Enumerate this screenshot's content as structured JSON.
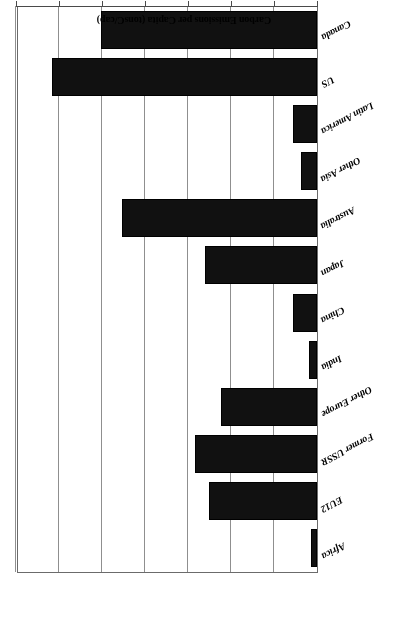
{
  "figure": {
    "orientation_note": "scanned-upside-down",
    "bar_color": "#111111",
    "grid_color": "#8f8f8f",
    "axis_color": "#4a4a4a"
  },
  "chart_data": {
    "type": "bar",
    "orientation": "horizontal",
    "title": "",
    "xlabel": "Carbon Emissions per Capita (tonsC/cap)",
    "ylabel": "",
    "xlim": [
      0.0,
      7.0
    ],
    "xticks": [
      "0.00",
      "1.00",
      "2.00",
      "3.00",
      "4.00",
      "5.00",
      "6.00",
      "7.00"
    ],
    "xtick_values": [
      0.0,
      1.0,
      2.0,
      3.0,
      4.0,
      5.0,
      6.0,
      7.0
    ],
    "grid": true,
    "legend": "none",
    "categories": [
      "Canada",
      "US",
      "Latin America",
      "Other Asia",
      "Australia",
      "Japan",
      "China",
      "India",
      "Other Europe",
      "Former USSR",
      "EU12",
      "Africa"
    ],
    "values": [
      5.02,
      6.16,
      0.56,
      0.37,
      4.53,
      2.6,
      0.56,
      0.19,
      2.23,
      2.84,
      2.51,
      0.14
    ]
  }
}
